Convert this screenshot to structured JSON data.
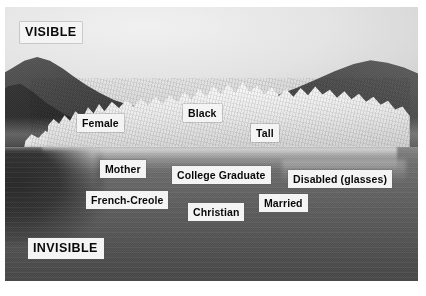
{
  "figure": {
    "kind": "iceberg-diagram",
    "background_color": "#ffffff",
    "label_background_color": "#f2f2f2",
    "label_text_color": "#0b0b0b"
  },
  "sections": {
    "above_water": {
      "label": "VISIBLE"
    },
    "below_water": {
      "label": "INVISIBLE"
    }
  },
  "labels": {
    "visible": [
      {
        "text": "Female",
        "left": 77,
        "top": 114
      },
      {
        "text": "Black",
        "left": 183,
        "top": 104
      },
      {
        "text": "Tall",
        "left": 251,
        "top": 124
      }
    ],
    "invisible": [
      {
        "text": "Mother",
        "left": 100,
        "top": 160
      },
      {
        "text": "College Graduate",
        "left": 172,
        "top": 166
      },
      {
        "text": "Disabled (glasses)",
        "left": 288,
        "top": 170
      },
      {
        "text": "French-Creole",
        "left": 86,
        "top": 191
      },
      {
        "text": "Married",
        "left": 259,
        "top": 194
      },
      {
        "text": "Christian",
        "left": 188,
        "top": 203
      }
    ]
  }
}
